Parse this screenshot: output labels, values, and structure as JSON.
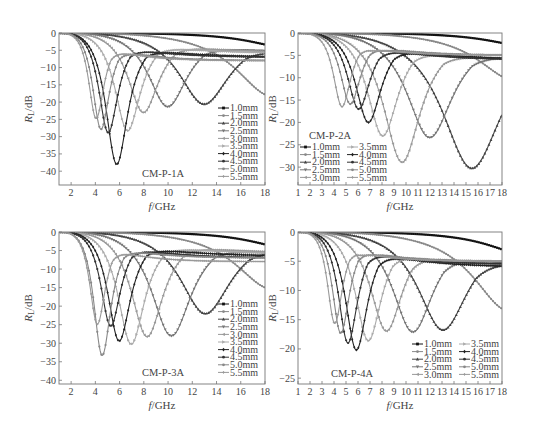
{
  "chart_data": [
    {
      "type": "line",
      "panel": "top-left",
      "sample_label": "CM-P-1A",
      "xlabel": "f/GHz",
      "ylabel": "R_L/dB",
      "xlim": [
        1,
        18
      ],
      "ylim": [
        -44,
        0
      ],
      "xticks": [
        2,
        4,
        6,
        8,
        10,
        12,
        14,
        16,
        18
      ],
      "yticks": [
        0,
        -5,
        -10,
        -15,
        -20,
        -25,
        -30,
        -35,
        -40
      ],
      "legend_position": "lower right",
      "legend_columns": 1,
      "series": [
        {
          "name": "1.0mm",
          "color": "#111111",
          "marker": "square",
          "min_freq": 20,
          "min_rl": -4.5,
          "end_rl": -3.5
        },
        {
          "name": "1.5mm",
          "color": "#888888",
          "marker": "circle",
          "min_freq": 18.5,
          "min_rl": -19,
          "end_rl": -19
        },
        {
          "name": "2.0mm",
          "color": "#444444",
          "marker": "triangle",
          "min_freq": 12.9,
          "min_rl": -21.5,
          "end_rl": -7.5
        },
        {
          "name": "2.5mm",
          "color": "#777777",
          "marker": "down-triangle",
          "min_freq": 9.9,
          "min_rl": -22.5,
          "end_rl": -6.5
        },
        {
          "name": "3.0mm",
          "color": "#999999",
          "marker": "left-triangle",
          "min_freq": 7.9,
          "min_rl": -24.5,
          "end_rl": -6
        },
        {
          "name": "3.5mm",
          "color": "#aaaaaa",
          "marker": "right-triangle",
          "min_freq": 6.6,
          "min_rl": -30.5,
          "end_rl": -6
        },
        {
          "name": "4.0mm",
          "color": "#222222",
          "marker": "diamond",
          "min_freq": 5.7,
          "min_rl": -41.5,
          "end_rl": -7
        },
        {
          "name": "4.5mm",
          "color": "#333333",
          "marker": "pentagon",
          "min_freq": 5.0,
          "min_rl": -32,
          "end_rl": -7
        },
        {
          "name": "5.0mm",
          "color": "#888888",
          "marker": "hexagon",
          "min_freq": 4.4,
          "min_rl": -31.5,
          "end_rl": -8
        },
        {
          "name": "5.5mm",
          "color": "#999999",
          "marker": "star",
          "min_freq": 4.0,
          "min_rl": -28.5,
          "end_rl": -8
        }
      ]
    },
    {
      "type": "line",
      "panel": "top-right",
      "sample_label": "CM-P-2A",
      "xlabel": "f/GHz",
      "ylabel": "R_L/dB",
      "xlim": [
        1,
        18
      ],
      "ylim": [
        -34,
        0
      ],
      "xticks": [
        1,
        2,
        3,
        4,
        5,
        6,
        7,
        8,
        9,
        10,
        11,
        12,
        13,
        14,
        15,
        16,
        17,
        18
      ],
      "yticks": [
        0,
        -5,
        -10,
        -15,
        -20,
        -25,
        -30
      ],
      "legend_position": "lower left",
      "legend_columns": 2,
      "series": [
        {
          "name": "1.0mm",
          "color": "#111111",
          "marker": "square",
          "min_freq": 20,
          "min_rl": -3,
          "end_rl": -2.5
        },
        {
          "name": "1.5mm",
          "color": "#888888",
          "marker": "circle",
          "min_freq": 19,
          "min_rl": -11,
          "end_rl": -11
        },
        {
          "name": "2.0mm",
          "color": "#444444",
          "marker": "triangle",
          "min_freq": 15.4,
          "min_rl": -31.5,
          "end_rl": -11.5
        },
        {
          "name": "2.5mm",
          "color": "#777777",
          "marker": "down-triangle",
          "min_freq": 11.9,
          "min_rl": -24.5,
          "end_rl": -7.5
        },
        {
          "name": "3.0mm",
          "color": "#999999",
          "marker": "left-triangle",
          "min_freq": 9.6,
          "min_rl": -30.5,
          "end_rl": -7
        },
        {
          "name": "3.5mm",
          "color": "#aaaaaa",
          "marker": "right-triangle",
          "min_freq": 8.0,
          "min_rl": -24.5,
          "end_rl": -6.5
        },
        {
          "name": "4.0mm",
          "color": "#222222",
          "marker": "diamond",
          "min_freq": 6.8,
          "min_rl": -21.5,
          "end_rl": -6
        },
        {
          "name": "4.5mm",
          "color": "#333333",
          "marker": "pentagon",
          "min_freq": 6.0,
          "min_rl": -18.5,
          "end_rl": -6
        },
        {
          "name": "5.0mm",
          "color": "#888888",
          "marker": "hexagon",
          "min_freq": 5.3,
          "min_rl": -17.5,
          "end_rl": -5
        },
        {
          "name": "5.5mm",
          "color": "#999999",
          "marker": "star",
          "min_freq": 4.6,
          "min_rl": -18.5,
          "end_rl": -5
        }
      ]
    },
    {
      "type": "line",
      "panel": "bottom-left",
      "sample_label": "CM-P-3A",
      "xlabel": "f/GHz",
      "ylabel": "R_L/dB",
      "xlim": [
        1,
        18
      ],
      "ylim": [
        -41,
        0
      ],
      "xticks": [
        2,
        4,
        6,
        8,
        10,
        12,
        14,
        16,
        18
      ],
      "yticks": [
        0,
        -5,
        -10,
        -15,
        -20,
        -25,
        -30,
        -35,
        -40
      ],
      "legend_position": "lower right",
      "legend_columns": 1,
      "series": [
        {
          "name": "1.0mm",
          "color": "#111111",
          "marker": "square",
          "min_freq": 20,
          "min_rl": -4.5,
          "end_rl": -3.5
        },
        {
          "name": "1.5mm",
          "color": "#888888",
          "marker": "circle",
          "min_freq": 18.5,
          "min_rl": -16,
          "end_rl": -16
        },
        {
          "name": "2.0mm",
          "color": "#444444",
          "marker": "triangle",
          "min_freq": 13.0,
          "min_rl": -23,
          "end_rl": -7.5
        },
        {
          "name": "2.5mm",
          "color": "#777777",
          "marker": "down-triangle",
          "min_freq": 10.2,
          "min_rl": -29.5,
          "end_rl": -7
        },
        {
          "name": "3.0mm",
          "color": "#999999",
          "marker": "left-triangle",
          "min_freq": 8.2,
          "min_rl": -30,
          "end_rl": -6
        },
        {
          "name": "3.5mm",
          "color": "#aaaaaa",
          "marker": "right-triangle",
          "min_freq": 6.9,
          "min_rl": -32.5,
          "end_rl": -6
        },
        {
          "name": "4.0mm",
          "color": "#222222",
          "marker": "diamond",
          "min_freq": 5.9,
          "min_rl": -32,
          "end_rl": -6.5
        },
        {
          "name": "4.5mm",
          "color": "#333333",
          "marker": "pentagon",
          "min_freq": 5.2,
          "min_rl": -28,
          "end_rl": -7
        },
        {
          "name": "5.0mm",
          "color": "#888888",
          "marker": "hexagon",
          "min_freq": 4.5,
          "min_rl": -37.5,
          "end_rl": -7
        },
        {
          "name": "5.5mm",
          "color": "#999999",
          "marker": "star",
          "min_freq": 4.1,
          "min_rl": -28.5,
          "end_rl": -8
        }
      ]
    },
    {
      "type": "line",
      "panel": "bottom-right",
      "sample_label": "CM-P-4A",
      "xlabel": "f/GHz",
      "ylabel": "R_L/dB",
      "xlim": [
        1,
        18
      ],
      "ylim": [
        -26,
        0
      ],
      "xticks": [
        1,
        2,
        3,
        4,
        5,
        6,
        7,
        8,
        9,
        10,
        11,
        12,
        13,
        14,
        15,
        16,
        17,
        18
      ],
      "yticks": [
        0,
        -5,
        -10,
        -15,
        -20,
        -25
      ],
      "legend_position": "lower right",
      "legend_columns": 2,
      "series": [
        {
          "name": "1.0mm",
          "color": "#111111",
          "marker": "square",
          "min_freq": 20,
          "min_rl": -4,
          "end_rl": -3.5
        },
        {
          "name": "1.5mm",
          "color": "#888888",
          "marker": "circle",
          "min_freq": 18.5,
          "min_rl": -14,
          "end_rl": -14
        },
        {
          "name": "2.0mm",
          "color": "#444444",
          "marker": "triangle",
          "min_freq": 13.0,
          "min_rl": -17.5,
          "end_rl": -8
        },
        {
          "name": "2.5mm",
          "color": "#777777",
          "marker": "down-triangle",
          "min_freq": 10.5,
          "min_rl": -18,
          "end_rl": -7
        },
        {
          "name": "3.0mm",
          "color": "#999999",
          "marker": "left-triangle",
          "min_freq": 8.3,
          "min_rl": -18,
          "end_rl": -6.5
        },
        {
          "name": "3.5mm",
          "color": "#aaaaaa",
          "marker": "right-triangle",
          "min_freq": 6.8,
          "min_rl": -20,
          "end_rl": -6
        },
        {
          "name": "4.0mm",
          "color": "#222222",
          "marker": "diamond",
          "min_freq": 5.8,
          "min_rl": -22,
          "end_rl": -6
        },
        {
          "name": "4.5mm",
          "color": "#333333",
          "marker": "pentagon",
          "min_freq": 5.1,
          "min_rl": -21,
          "end_rl": -5.5
        },
        {
          "name": "5.0mm",
          "color": "#888888",
          "marker": "hexagon",
          "min_freq": 4.5,
          "min_rl": -19.5,
          "end_rl": -5
        },
        {
          "name": "5.5mm",
          "color": "#999999",
          "marker": "star",
          "min_freq": 4.0,
          "min_rl": -18,
          "end_rl": -5
        }
      ]
    }
  ],
  "panels": [
    {
      "frame": {
        "x": 59,
        "y": 33,
        "w": 206,
        "h": 152
      },
      "legend": {
        "x": 218,
        "y": 108,
        "row_h": 7.6
      },
      "sample_pos": {
        "x": 163,
        "y": 177
      },
      "ylabel_x": 32,
      "ylabel_y": 109
    },
    {
      "frame": {
        "x": 298,
        "y": 33,
        "w": 204,
        "h": 152
      },
      "legend": {
        "x": 300,
        "y": 147,
        "row_h": 7.6
      },
      "sample_pos": {
        "x": 330,
        "y": 139
      },
      "ylabel_x": 276,
      "ylabel_y": 109
    },
    {
      "frame": {
        "x": 59,
        "y": 232,
        "w": 206,
        "h": 152
      },
      "legend": {
        "x": 218,
        "y": 304,
        "row_h": 7.6
      },
      "sample_pos": {
        "x": 163,
        "y": 376
      },
      "ylabel_x": 32,
      "ylabel_y": 308
    },
    {
      "frame": {
        "x": 298,
        "y": 232,
        "w": 204,
        "h": 152
      },
      "legend": {
        "x": 412,
        "y": 344,
        "row_h": 7.6
      },
      "sample_pos": {
        "x": 352,
        "y": 377
      },
      "ylabel_x": 276,
      "ylabel_y": 308
    }
  ]
}
